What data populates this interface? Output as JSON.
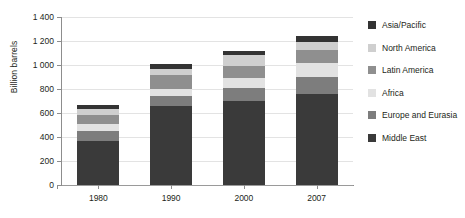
{
  "chart_data": {
    "type": "bar",
    "stacked": true,
    "title": "",
    "xlabel": "",
    "ylabel": "Billion barrels",
    "categories": [
      "1980",
      "1990",
      "2000",
      "2007"
    ],
    "ylim": [
      0,
      1400
    ],
    "yticks": [
      0,
      200,
      400,
      600,
      800,
      1000,
      1200,
      1400
    ],
    "ytick_labels": [
      "0",
      "200",
      "400",
      "600",
      "800",
      "1 000",
      "1 200",
      "1 400"
    ],
    "grid": true,
    "legend_position": "right",
    "series": [
      {
        "name": "Middle East",
        "color": "#3a3a3a",
        "values": [
          365,
          660,
          700,
          755
        ]
      },
      {
        "name": "Europe and Eurasia",
        "color": "#7d7d7d",
        "values": [
          85,
          80,
          110,
          145
        ]
      },
      {
        "name": "Africa",
        "color": "#e2e2e2",
        "values": [
          55,
          60,
          85,
          115
        ]
      },
      {
        "name": "Latin America",
        "color": "#8f8f8f",
        "values": [
          75,
          120,
          100,
          110
        ]
      },
      {
        "name": "North America",
        "color": "#cfcfcf",
        "values": [
          50,
          50,
          85,
          70
        ]
      },
      {
        "name": "Asia/Pacific",
        "color": "#333333",
        "values": [
          35,
          35,
          40,
          45
        ]
      }
    ],
    "totals": [
      665,
      1005,
      1120,
      1240
    ]
  },
  "legend": {
    "items": [
      {
        "label": "Asia/Pacific",
        "color": "#333333"
      },
      {
        "label": "North America",
        "color": "#cfcfcf"
      },
      {
        "label": "Latin America",
        "color": "#8f8f8f"
      },
      {
        "label": "Africa",
        "color": "#e2e2e2"
      },
      {
        "label": "Europe and Eurasia",
        "color": "#7d7d7d"
      },
      {
        "label": "Middle East",
        "color": "#3a3a3a"
      }
    ]
  },
  "colors": {
    "background": "#ffffff",
    "axis": "#8d8d8d",
    "gridline": "#e3e3e3",
    "text": "#231f20"
  }
}
